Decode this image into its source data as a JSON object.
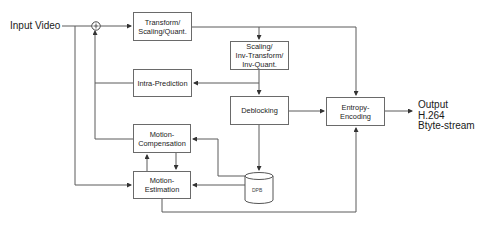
{
  "diagram": {
    "input_label": "Input Video",
    "output_label": "Output H.264\nBtyte-stream",
    "summing_node_symbol": "+",
    "blocks": {
      "transform": "Transform/\nScaling/Quant.",
      "inverse": "Scaling/\nInv-Transform/\nInv-Quant.",
      "intra": "Intra-Prediction",
      "deblocking": "Deblocking",
      "entropy": "Entropy-\nEncoding",
      "motion_compensation": "Motion-\nCompensation",
      "motion_estimation": "Motion-\nEstimation",
      "dpb": "DPB"
    },
    "colors": {
      "line": "#5a5a5a",
      "box_border": "#6a6a6a",
      "text": "#1a1a1a"
    }
  }
}
